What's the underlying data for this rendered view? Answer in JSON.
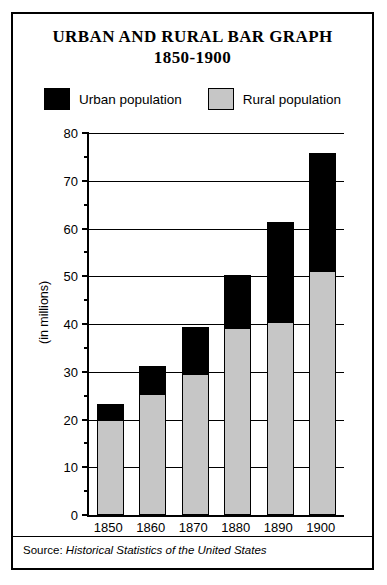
{
  "figure": {
    "title_line1": "URBAN AND RURAL BAR GRAPH",
    "title_line2": "1850-1900",
    "source_lead": "Source:",
    "source_body": "Historical Statistics of the United States",
    "y_axis_caption": "(in millions)"
  },
  "legend": {
    "items": [
      {
        "label": "Urban population",
        "color": "#000000",
        "key": "urban"
      },
      {
        "label": "Rural population",
        "color": "#c6c6c6",
        "key": "rural"
      }
    ]
  },
  "chart_data": {
    "type": "bar",
    "stacked": true,
    "title": "URBAN AND RURAL BAR GRAPH 1850-1900",
    "xlabel": "",
    "ylabel": "(in millions)",
    "ylim": [
      0,
      80
    ],
    "ytick_major": [
      0,
      10,
      20,
      30,
      40,
      50,
      60,
      70,
      80
    ],
    "ytick_minor": [
      5,
      15,
      25,
      35,
      45,
      55,
      65,
      75
    ],
    "ytick_labels": [
      "0",
      "10",
      "20",
      "30",
      "40",
      "50",
      "60",
      "70",
      "80"
    ],
    "grid": "horizontal-major",
    "legend_position": "top",
    "categories": [
      "1850",
      "1860",
      "1870",
      "1880",
      "1890",
      "1900"
    ],
    "series": [
      {
        "name": "Rural population",
        "color": "#c6c6c6",
        "values": [
          19.6,
          25.2,
          29.3,
          39.0,
          40.3,
          50.8
        ]
      },
      {
        "name": "Urban population",
        "color": "#000000",
        "values": [
          3.6,
          6.0,
          10.0,
          11.2,
          21.1,
          25.1
        ]
      }
    ],
    "totals": [
      23.2,
      31.2,
      39.3,
      50.2,
      61.4,
      75.9
    ],
    "source": "Source: Historical Statistics of the United States"
  }
}
